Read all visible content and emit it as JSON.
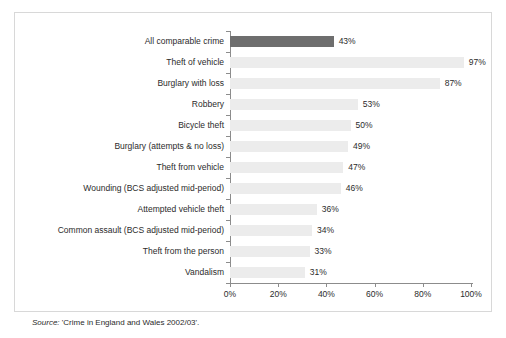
{
  "chart_data": {
    "type": "bar",
    "orientation": "horizontal",
    "title": "",
    "subtitle": "",
    "xlabel": "",
    "ylabel": "",
    "xlim": [
      0,
      100
    ],
    "grid": false,
    "legend": null,
    "categories": [
      "All comparable crime",
      "Theft of vehicle",
      "Burglary with loss",
      "Robbery",
      "Bicycle theft",
      "Burglary (attempts & no loss)",
      "Theft from vehicle",
      "Wounding (BCS adjusted mid-period)",
      "Attempted vehicle theft",
      "Common assault (BCS adjusted mid-period)",
      "Theft from the person",
      "Vandalism"
    ],
    "values": [
      43,
      97,
      87,
      53,
      50,
      49,
      47,
      46,
      36,
      34,
      33,
      31
    ],
    "value_labels": [
      "43%",
      "97%",
      "87%",
      "53%",
      "50%",
      "49%",
      "47%",
      "46%",
      "36%",
      "34%",
      "33%",
      "31%"
    ],
    "highlighted": [
      true,
      false,
      false,
      false,
      false,
      false,
      false,
      false,
      false,
      false,
      false,
      false
    ],
    "xticks": [
      0,
      20,
      40,
      60,
      80,
      100
    ],
    "xtick_labels": [
      "0%",
      "20%",
      "40%",
      "60%",
      "80%",
      "100%"
    ],
    "colors": {
      "highlight_bar": "#6e6e6e",
      "bar": "#ececec",
      "axis": "#8c8c8c",
      "text": "#2b2b2b",
      "frame": "#d8d8d8",
      "background": "#ffffff"
    }
  },
  "source": {
    "label": "Source:",
    "text": " 'Crime in England and Wales 2002/03'."
  }
}
